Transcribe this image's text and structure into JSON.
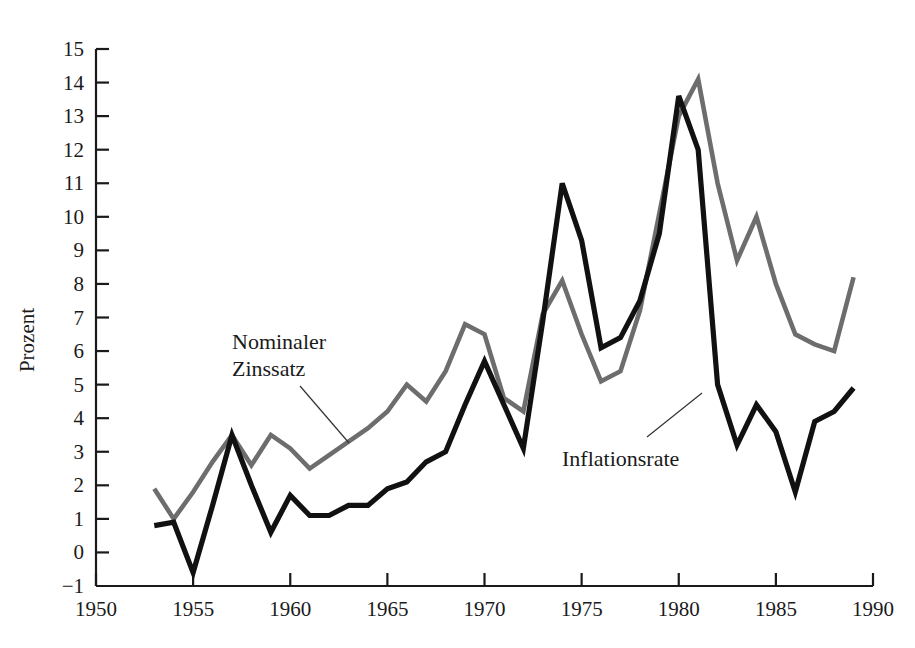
{
  "chart_data": {
    "type": "line",
    "title": "",
    "xlabel": "",
    "ylabel": "Prozent",
    "xlim": [
      1950,
      1990
    ],
    "ylim": [
      -1,
      15
    ],
    "xticks": [
      1950,
      1955,
      1960,
      1965,
      1970,
      1975,
      1980,
      1985,
      1990
    ],
    "yticks": [
      -1,
      0,
      1,
      2,
      3,
      4,
      5,
      6,
      7,
      8,
      9,
      10,
      11,
      12,
      13,
      14,
      15
    ],
    "grid": false,
    "legend_position": "inline-annotations",
    "x": [
      1953,
      1954,
      1955,
      1956,
      1957,
      1958,
      1959,
      1960,
      1961,
      1962,
      1963,
      1964,
      1965,
      1966,
      1967,
      1968,
      1969,
      1970,
      1971,
      1972,
      1973,
      1974,
      1975,
      1976,
      1977,
      1978,
      1979,
      1980,
      1981,
      1982,
      1983,
      1984,
      1985,
      1986,
      1987,
      1988,
      1989
    ],
    "series": [
      {
        "name": "Nominaler Zinssatz",
        "color": "#6d6d6d",
        "values": [
          1.9,
          1.0,
          1.8,
          2.7,
          3.5,
          2.6,
          3.5,
          3.1,
          2.5,
          2.9,
          3.3,
          3.7,
          4.2,
          5.0,
          4.5,
          5.4,
          6.8,
          6.5,
          4.6,
          4.2,
          7.1,
          8.1,
          6.5,
          5.1,
          5.4,
          7.2,
          10.1,
          13.0,
          14.1,
          11.0,
          8.7,
          10.0,
          8.0,
          6.5,
          6.2,
          6.0,
          8.2
        ]
      },
      {
        "name": "Inflationsrate",
        "color": "#111111",
        "values": [
          0.8,
          0.9,
          -0.6,
          1.4,
          3.5,
          2.0,
          0.6,
          1.7,
          1.1,
          1.1,
          1.4,
          1.4,
          1.9,
          2.1,
          2.7,
          3.0,
          4.4,
          5.7,
          4.4,
          3.1,
          6.9,
          11.0,
          9.3,
          6.1,
          6.4,
          7.5,
          9.5,
          13.6,
          12.0,
          5.0,
          3.2,
          4.4,
          3.6,
          1.8,
          3.9,
          4.2,
          4.9
        ]
      }
    ],
    "annotations": [
      {
        "text_line1": "Nominaler",
        "text_line2": "Zinssatz",
        "target_series": "Nominaler Zinssatz"
      },
      {
        "text_line1": "Inflationsrate",
        "text_line2": "",
        "target_series": "Inflationsrate"
      }
    ]
  }
}
